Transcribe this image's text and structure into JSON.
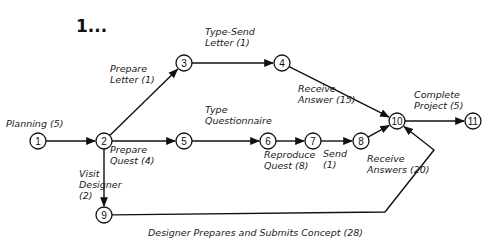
{
  "title": "1...",
  "nodes": [
    {
      "id": "1",
      "label": "1"
    },
    {
      "id": "2",
      "label": "2"
    },
    {
      "id": "3",
      "label": "3"
    },
    {
      "id": "4",
      "label": "4"
    },
    {
      "id": "5",
      "label": "5"
    },
    {
      "id": "6",
      "label": "6"
    },
    {
      "id": "7",
      "label": "7"
    },
    {
      "id": "8",
      "label": "8"
    },
    {
      "id": "9",
      "label": "9"
    },
    {
      "id": "10",
      "label": "10"
    },
    {
      "id": "11",
      "label": "11"
    }
  ],
  "activities": [
    {
      "from": "1",
      "to": "2",
      "lines": [
        "Planning (5)"
      ]
    },
    {
      "from": "2",
      "to": "3",
      "lines": [
        "Prepare",
        "Letter (1)"
      ]
    },
    {
      "from": "3",
      "to": "4",
      "lines": [
        "Type-Send",
        "Letter (1)"
      ]
    },
    {
      "from": "4",
      "to": "10",
      "lines": [
        "Receive",
        "Answer (15)"
      ]
    },
    {
      "from": "2",
      "to": "5",
      "lines": [
        "Prepare",
        "Quest (4)"
      ]
    },
    {
      "from": "5",
      "to": "6",
      "lines": [
        "Type",
        "Questionnaire"
      ]
    },
    {
      "from": "6",
      "to": "7",
      "lines": [
        "Reproduce",
        "Quest (8)"
      ]
    },
    {
      "from": "7",
      "to": "8",
      "lines": [
        "Send",
        "(1)"
      ]
    },
    {
      "from": "8",
      "to": "10",
      "lines": [
        "Receive",
        "Answers (20)"
      ]
    },
    {
      "from": "2",
      "to": "9",
      "lines": [
        "Visit",
        "Designer",
        "(2)"
      ]
    },
    {
      "from": "9",
      "to": "10",
      "lines": [
        "Designer Prepares and Submits Concept (28)"
      ]
    },
    {
      "from": "10",
      "to": "11",
      "lines": [
        "Complete",
        "Project (5)"
      ]
    }
  ]
}
